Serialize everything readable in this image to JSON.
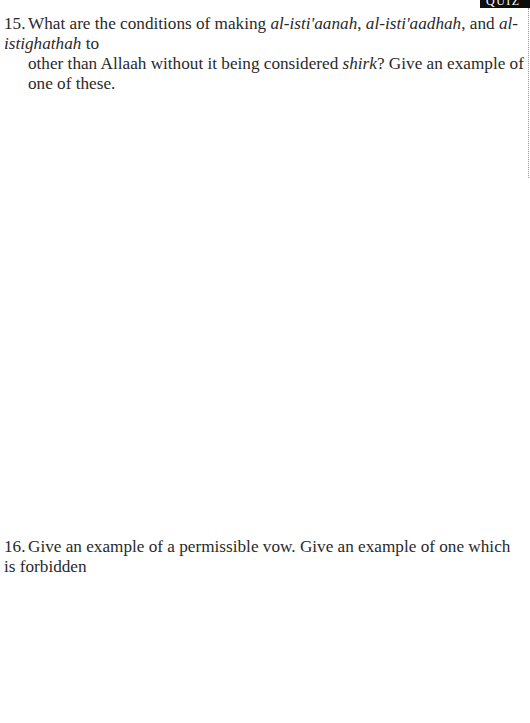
{
  "header": {
    "tab_label": "QUIZ"
  },
  "questions": [
    {
      "number": "15.",
      "line1_prefix": "What are the conditions of making ",
      "term1": "al-isti'aanah",
      "sep1": ", ",
      "term2": "al-isti'aadhah",
      "sep2": ", and ",
      "term3": "al-istighathah",
      "line1_suffix": " to",
      "line2_prefix": "other than Allaah without it being considered ",
      "term4": "shirk",
      "line2_suffix": "? Give an example of one of these."
    },
    {
      "number": "16.",
      "text": "Give an example of a permissible vow. Give an example of one which is forbidden"
    }
  ],
  "colors": {
    "text": "#2a2a2a",
    "tab_background": "#0d0d0d",
    "tab_text": "#ffffff",
    "page_background": "#ffffff"
  }
}
